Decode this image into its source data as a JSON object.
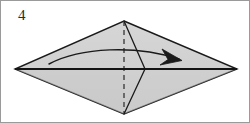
{
  "figure": {
    "kind": "origami-fold-diagram",
    "step_label": "4",
    "caption": "",
    "canvas": {
      "width": 250,
      "height": 123
    },
    "border_color": "#9a9a9a",
    "background_color": "#ffffff",
    "paper": {
      "name": "kite-diamond-shape",
      "fill_color": "#d2d2d2",
      "fill_color_shade": "#c6c6c6",
      "outline_color": "#1a1a1a",
      "outline_width": 1.4,
      "vertices": {
        "top": [
          123,
          20
        ],
        "right": [
          236,
          68
        ],
        "bottom": [
          123,
          113
        ],
        "left": [
          14,
          68
        ]
      },
      "points_path": "123,20 236,68 123,113 14,68"
    },
    "creases": [
      {
        "name": "horizontal-center-crease",
        "type": "solid",
        "color": "#1a1a1a",
        "width": 2.0,
        "from": [
          14,
          68
        ],
        "to": [
          236,
          68
        ]
      },
      {
        "name": "vertical-center-fold-line",
        "type": "dashed",
        "color": "#4a4a4a",
        "width": 1.5,
        "dash": "5,4",
        "from": [
          123,
          20
        ],
        "to": [
          123,
          113
        ]
      },
      {
        "name": "upper-flap-fold-line",
        "type": "solid",
        "color": "#1a1a1a",
        "width": 1.3,
        "from": [
          123,
          20
        ],
        "to": [
          144,
          68
        ]
      },
      {
        "name": "lower-flap-fold-line",
        "type": "solid",
        "color": "#1a1a1a",
        "width": 1.3,
        "from": [
          144,
          68
        ],
        "to": [
          123,
          113
        ]
      }
    ],
    "arrow": {
      "name": "fold-direction-arrow",
      "description": "curved arrow sweeping from left side to the right",
      "color": "#1a1a1a",
      "width": 1.5,
      "path": "M 48,63 C 80,46 135,44 178,58",
      "head": {
        "tip": [
          180,
          59
        ],
        "wing_upper": [
          163,
          49
        ],
        "wing_lower": [
          161,
          63
        ]
      }
    }
  }
}
